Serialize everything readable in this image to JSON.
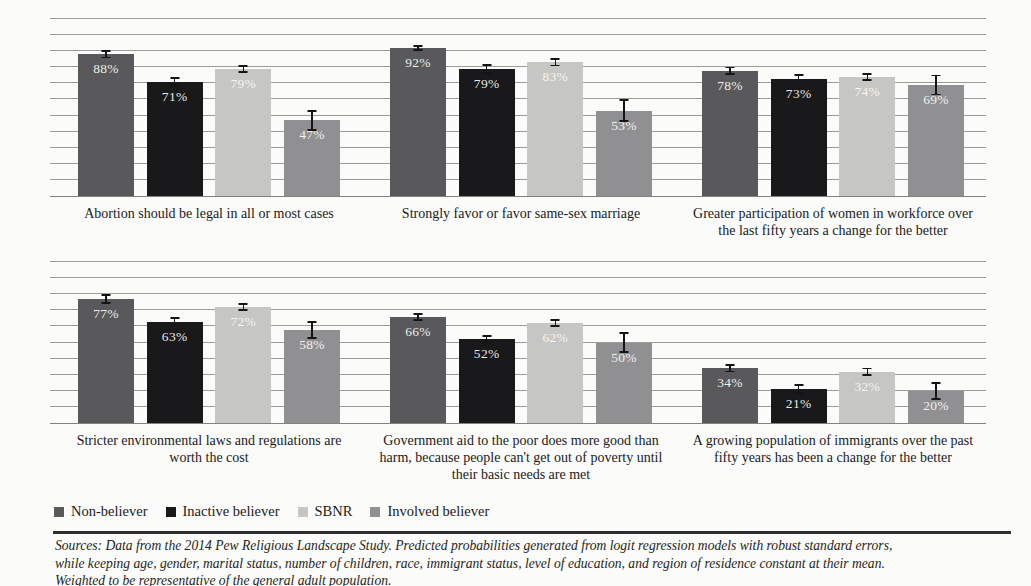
{
  "colors": {
    "non_believer": "#59595b",
    "inactive_believer": "#19191b",
    "sbnr": "#c6c6c4",
    "involved_believer": "#909092",
    "gridline": "#9b9b99",
    "baseline": "#82827f",
    "rule": "#2e2e2e",
    "background": "#fbfbf9",
    "bar_label": "#faf9f4"
  },
  "legend": {
    "items": [
      {
        "key": "non_believer",
        "label": "Non-believer"
      },
      {
        "key": "inactive_believer",
        "label": "Inactive believer"
      },
      {
        "key": "sbnr",
        "label": "SBNR"
      },
      {
        "key": "involved_believer",
        "label": "Involved believer"
      }
    ]
  },
  "footer": {
    "lines": [
      "Sources: Data from the 2014 Pew Religious Landscape Study. Predicted probabilities generated from logit regression models with robust standard errors,",
      "while keeping age, gender, marital status, number of children, race, immigrant status, level of education, and region of residence constant at their mean.",
      "Weighted to be representative of the general adult population."
    ]
  },
  "chart_data": {
    "type": "bar",
    "unit": "%",
    "series_keys": [
      "non_believer",
      "inactive_believer",
      "sbnr",
      "involved_believer"
    ],
    "series_names": [
      "Non-believer",
      "Inactive believer",
      "SBNR",
      "Involved believer"
    ],
    "ylim": [
      0,
      110
    ],
    "gridline_step": 10,
    "legend_position": "bottom-left",
    "grid": true,
    "rows": [
      {
        "grid_max": 110,
        "top_px": 19,
        "height_px": 177,
        "groups": [
          {
            "label_lines": [
              "Abortion should be legal in all or most cases"
            ],
            "values": [
              88,
              71,
              79,
              47
            ],
            "moe": [
              2.5,
              3,
              2.5,
              6.5
            ]
          },
          {
            "label_lines": [
              "Strongly favor or favor same-sex marriage"
            ],
            "values": [
              92,
              79,
              83,
              53
            ],
            "moe": [
              2,
              3,
              2.5,
              7
            ]
          },
          {
            "label_lines": [
              "Greater participation of women in workforce over",
              "the last  fifty years a change for the better"
            ],
            "values": [
              78,
              73,
              74,
              69
            ],
            "moe": [
              2.5,
              3,
              2.5,
              6.5
            ]
          }
        ]
      },
      {
        "grid_max": 100,
        "top_px": 262,
        "height_px": 161,
        "groups": [
          {
            "label_lines": [
              "Stricter environmental laws and regulations are",
              "worth the cost"
            ],
            "values": [
              77,
              63,
              72,
              58
            ],
            "moe": [
              3,
              3,
              2.5,
              5.5
            ]
          },
          {
            "label_lines": [
              "Government aid to the poor does more good than",
              "harm, because people can't get out of poverty until",
              "their basic needs are met"
            ],
            "values": [
              66,
              52,
              62,
              50
            ],
            "moe": [
              2.5,
              2.5,
              2.5,
              6.5
            ]
          },
          {
            "label_lines": [
              "A growing population of immigrants over the past",
              "fifty years has been a change for the better"
            ],
            "values": [
              34,
              21,
              32,
              20
            ],
            "moe": [
              2.5,
              3,
              2.5,
              5.5
            ]
          }
        ]
      }
    ],
    "layout": {
      "px_per_point": 1.609,
      "cluster_lefts": [
        28,
        340,
        652
      ],
      "cluster_width": 262,
      "bar_width": 56,
      "label_gap": 9
    }
  }
}
